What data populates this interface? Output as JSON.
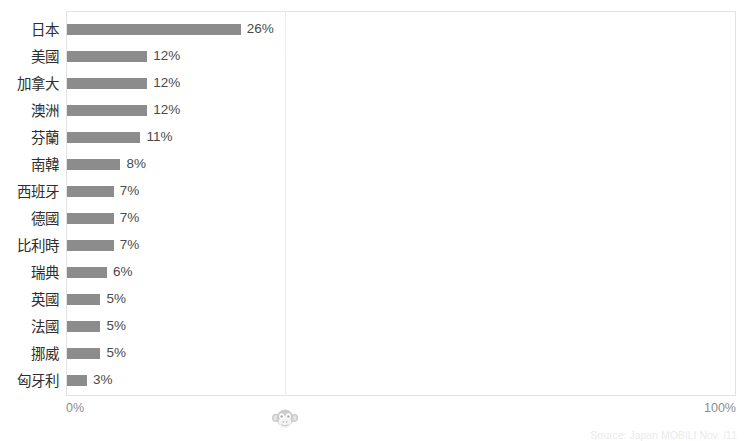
{
  "chart_data": {
    "type": "bar",
    "orientation": "horizontal",
    "title": "",
    "xlabel": "",
    "ylabel": "",
    "xlim": [
      0,
      100
    ],
    "grid": true,
    "legend": "none",
    "value_suffix": "%",
    "categories": [
      "日本",
      "美國",
      "加拿大",
      "澳洲",
      "芬蘭",
      "南韓",
      "西班牙",
      "德國",
      "比利時",
      "瑞典",
      "英國",
      "法國",
      "挪威",
      "匈牙利"
    ],
    "values": [
      26,
      12,
      12,
      12,
      11,
      8,
      7,
      7,
      7,
      6,
      5,
      5,
      5,
      3
    ],
    "value_labels": [
      "26%",
      "12%",
      "12%",
      "12%",
      "11%",
      "8%",
      "7%",
      "7%",
      "7%",
      "6%",
      "5%",
      "5%",
      "5%",
      "3%"
    ],
    "bars": [
      {
        "label": "日本",
        "value": 26,
        "value_label": "26%"
      },
      {
        "label": "美國",
        "value": 12,
        "value_label": "12%"
      },
      {
        "label": "加拿大",
        "value": 12,
        "value_label": "12%"
      },
      {
        "label": "澳洲",
        "value": 12,
        "value_label": "12%"
      },
      {
        "label": "芬蘭",
        "value": 11,
        "value_label": "11%"
      },
      {
        "label": "南韓",
        "value": 8,
        "value_label": "8%"
      },
      {
        "label": "西班牙",
        "value": 7,
        "value_label": "7%"
      },
      {
        "label": "德國",
        "value": 7,
        "value_label": "7%"
      },
      {
        "label": "比利時",
        "value": 7,
        "value_label": "7%"
      },
      {
        "label": "瑞典",
        "value": 6,
        "value_label": "6%"
      },
      {
        "label": "英國",
        "value": 5,
        "value_label": "5%"
      },
      {
        "label": "法國",
        "value": 5,
        "value_label": "5%"
      },
      {
        "label": "挪威",
        "value": 5,
        "value_label": "5%"
      },
      {
        "label": "匈牙利",
        "value": 3,
        "value_label": "3%"
      }
    ],
    "xaxis": {
      "ticks": [
        0,
        100
      ],
      "tick_labels": [
        "0%",
        "100%"
      ]
    },
    "colors": {
      "bar": "#8c8c8c",
      "label_text": "#2e2e2e",
      "value_text": "#4a4a4a",
      "axis_text": "#8b8b8e",
      "plot_border": "#e3e3e6",
      "gridline": "#ededf0",
      "background": "#ffffff"
    }
  },
  "overlay": {
    "title_cutoff": "",
    "source_cutoff": "Source: Japan MOBILI Nov. /11",
    "watermark_icon": "monkey-face-icon"
  }
}
